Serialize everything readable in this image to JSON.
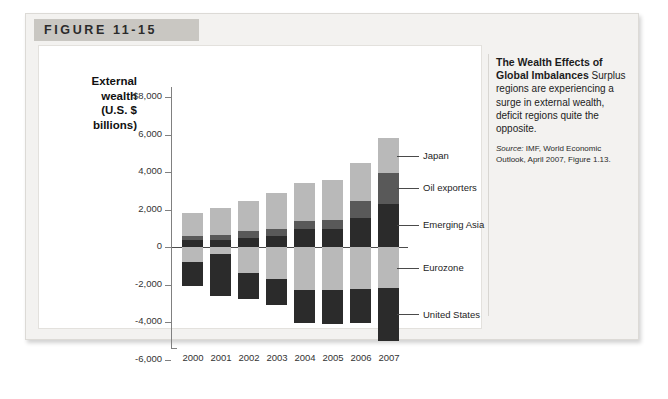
{
  "figure": {
    "header_label": "FIGURE 11-15"
  },
  "axis_title": {
    "line1": "External",
    "line2": "wealth",
    "line3": "(U.S. $",
    "line4": "billions)"
  },
  "caption": {
    "title": "The Wealth Effects of Global Imbalances",
    "body": " Surplus regions are experiencing a surge in external wealth, deficit regions quite the opposite.",
    "source_label": "Source:",
    "source_text": " IMF, World Economic Outlook, April 2007, Figure 1.13."
  },
  "callouts": [
    {
      "name": "emerging-asia",
      "label": "Emerging Asia"
    },
    {
      "name": "oil-exporters",
      "label": "Oil exporters"
    },
    {
      "name": "japan",
      "label": "Japan"
    },
    {
      "name": "eurozone",
      "label": "Eurozone"
    },
    {
      "name": "united-states",
      "label": "United States"
    }
  ],
  "colors": {
    "emerging_asia": "#2b2b2b",
    "oil_exporters": "#595959",
    "japan": "#b9b9b9",
    "eurozone": "#b9b9b9",
    "united_states": "#2b2b2b",
    "axis": "#808080",
    "zero_line": "#4c4c4c",
    "card_background": "#f3f2f0",
    "header_band": "#c9c7c2",
    "panel_background": "#ffffff"
  },
  "chart_data": {
    "type": "bar",
    "subtype": "stacked-bar-diverging",
    "title": "The Wealth Effects of Global Imbalances",
    "xlabel": "",
    "ylabel": "External wealth (U.S. $ billions)",
    "ylim": [
      -6000,
      8000
    ],
    "ytick_labels": [
      "$8,000",
      "6,000",
      "4,000",
      "2,000",
      "0",
      "-2,000",
      "-4,000",
      "-6,000"
    ],
    "ytick_values": [
      8000,
      6000,
      4000,
      2000,
      0,
      -2000,
      -4000,
      -6000
    ],
    "grid": false,
    "legend_position": "right-callouts",
    "categories": [
      "2000",
      "2001",
      "2002",
      "2003",
      "2004",
      "2005",
      "2006",
      "2007"
    ],
    "series": [
      {
        "name": "Emerging Asia",
        "color": "#2b2b2b",
        "values": [
          350,
          400,
          500,
          600,
          950,
          950,
          1550,
          2300
        ]
      },
      {
        "name": "Oil exporters",
        "color": "#595959",
        "values": [
          250,
          250,
          350,
          350,
          450,
          500,
          900,
          1650
        ]
      },
      {
        "name": "Japan",
        "color": "#b9b9b9",
        "values": [
          1200,
          1450,
          1600,
          1950,
          2000,
          2150,
          2050,
          1850
        ]
      },
      {
        "name": "Eurozone",
        "color": "#b9b9b9",
        "values": [
          -800,
          -350,
          -1400,
          -1700,
          -2300,
          -2300,
          -2250,
          -2200
        ]
      },
      {
        "name": "United States",
        "color": "#2b2b2b",
        "values": [
          -1300,
          -2250,
          -1350,
          -1400,
          -1750,
          -1800,
          -1800,
          -2800
        ]
      }
    ]
  }
}
